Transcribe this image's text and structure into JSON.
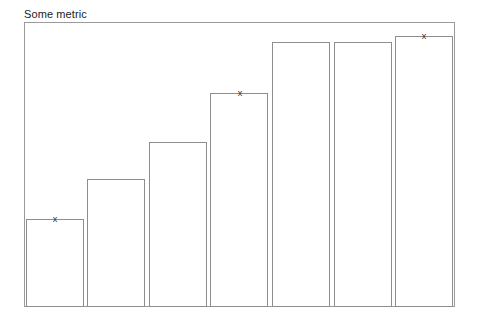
{
  "chart_data": {
    "type": "bar",
    "title": "Some metric",
    "subtitle": "",
    "xlabel": "",
    "ylabel": "",
    "grid": false,
    "legend": "none",
    "axis_tick_labels_x": [],
    "axis_tick_labels_y": [],
    "ylim": [
      0,
      100
    ],
    "categories": [
      "1",
      "2",
      "3",
      "4",
      "5",
      "6",
      "7"
    ],
    "values": [
      31,
      45,
      58,
      75,
      93,
      93,
      95
    ],
    "annotations": [
      {
        "category": "1",
        "label": "x",
        "value": 31
      },
      {
        "category": "4",
        "label": "x",
        "value": 75
      },
      {
        "category": "7",
        "label": "x",
        "value": 95
      }
    ],
    "bar_fill_color": "#ffffff",
    "bar_edge_color": "#8d8d8d",
    "frame_color": "#9a9a9a",
    "title_color": "#222222",
    "marker_glyph": "x"
  }
}
